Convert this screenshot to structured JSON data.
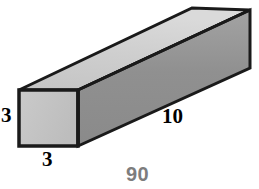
{
  "figure": {
    "name": "rectangular-prism-volume-figure",
    "shape_type": "rectangular prism",
    "background_color": "#ffffff",
    "outline_color": "#1a1a1a",
    "faces": {
      "front": {
        "name": "front-face",
        "fill": "#c2c2c2",
        "fill_light": "#cfcfcf",
        "points": "19,90 78,90 78,146 19,146"
      },
      "top": {
        "name": "top-face",
        "fill": "#cdcdcd",
        "fill_light": "#dcdcdc",
        "points": "19,90 78,90 250,10 192,8"
      },
      "side": {
        "name": "right-side-face",
        "fill": "#8f8f8f",
        "fill_light": "#a8a8a8",
        "points": "78,90 250,10 250,68 78,146"
      }
    }
  },
  "labels": {
    "height": "3",
    "depth": "3",
    "length": "10",
    "volume": "90",
    "volume_color": "#7d7d7d"
  }
}
